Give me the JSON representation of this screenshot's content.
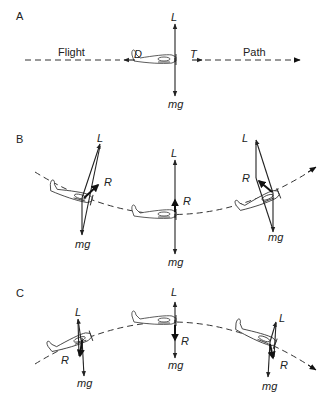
{
  "panels": [
    {
      "id": "A",
      "label": "A",
      "description": "Level flight",
      "path_labels": {
        "left": "Flight",
        "right": "Path"
      },
      "forces": {
        "lift": "L",
        "weight": "mg",
        "drag": "D",
        "thrust": "T"
      }
    },
    {
      "id": "B",
      "label": "B",
      "description": "Concave-up (pull-up) flight path",
      "aircraft": [
        {
          "position": "left",
          "lift": "L",
          "resultant": "R",
          "weight": "mg"
        },
        {
          "position": "center",
          "lift": "L",
          "resultant": "R",
          "weight": "mg"
        },
        {
          "position": "right",
          "lift": "L",
          "resultant": "R",
          "weight": "mg"
        }
      ]
    },
    {
      "id": "C",
      "label": "C",
      "description": "Convex (push-over) flight path",
      "aircraft": [
        {
          "position": "left",
          "lift": "L",
          "resultant": "R",
          "weight": "mg"
        },
        {
          "position": "center",
          "lift": "L",
          "resultant": "R",
          "weight": "mg"
        },
        {
          "position": "right",
          "lift": "L",
          "resultant": "R",
          "weight": "mg"
        }
      ]
    }
  ],
  "colors": {
    "ink": "#222222",
    "background": "#ffffff"
  }
}
